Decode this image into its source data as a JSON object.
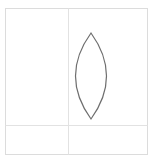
{
  "diagram": {
    "frame": {
      "x": 5,
      "y": 8,
      "width": 143,
      "height": 147,
      "stroke": "#dcdcdc"
    },
    "guides": {
      "vertical_x": 68,
      "horizontal_y": 125,
      "stroke": "#e2e2e2"
    },
    "shape": {
      "type": "lens",
      "top": [
        91,
        33
      ],
      "bottom": [
        91,
        119
      ],
      "half_width": 23,
      "stroke": "#6e6e6e"
    },
    "caption": ""
  }
}
